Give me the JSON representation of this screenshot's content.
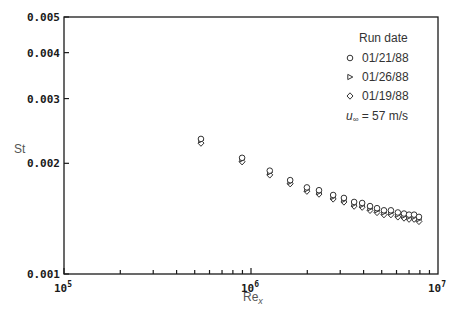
{
  "chart_data": {
    "type": "scatter",
    "title": "",
    "xlabel": "Re",
    "xlabel_sub": "x",
    "ylabel": "St",
    "xscale": "log",
    "yscale": "log",
    "xlim": [
      100000,
      10000000
    ],
    "ylim": [
      0.001,
      0.005
    ],
    "x_ticks": [
      {
        "value": 100000,
        "base": "10",
        "exp": "5"
      },
      {
        "value": 1000000,
        "base": "10",
        "exp": "6"
      },
      {
        "value": 10000000,
        "base": "10",
        "exp": "7"
      }
    ],
    "y_ticks": [
      {
        "value": 0.001,
        "label": "0.001"
      },
      {
        "value": 0.002,
        "label": "0.002"
      },
      {
        "value": 0.003,
        "label": "0.003"
      },
      {
        "value": 0.004,
        "label": "0.004"
      },
      {
        "value": 0.005,
        "label": "0.005"
      }
    ],
    "grid": false,
    "legend_position": "upper right",
    "legend_title": "Run date",
    "annotation": "u∞ = 57 m/s",
    "series": [
      {
        "name": "01/21/88",
        "marker": "circle",
        "x": [
          540000,
          896000,
          1260000,
          1620000,
          1990000,
          2310000,
          2750000,
          3140000,
          3560000,
          3930000,
          4330000,
          4720000,
          5140000,
          5600000,
          6100000,
          6580000,
          7000000,
          7450000,
          7910000
        ],
        "y": [
          0.00233,
          0.00207,
          0.00191,
          0.0018,
          0.00172,
          0.00169,
          0.00164,
          0.00161,
          0.00157,
          0.00156,
          0.00153,
          0.00151,
          0.00149,
          0.00149,
          0.00147,
          0.00146,
          0.00145,
          0.00145,
          0.00143
        ]
      },
      {
        "name": "01/26/88",
        "marker": "triangle-right",
        "x": [
          540000,
          896000,
          1260000,
          1620000,
          1990000,
          2310000,
          2750000,
          3140000,
          3560000,
          3930000,
          4330000,
          4720000,
          5140000,
          5600000,
          6100000,
          6580000,
          7000000,
          7450000,
          7910000
        ],
        "y": [
          0.00231,
          0.00205,
          0.00189,
          0.00178,
          0.0017,
          0.00167,
          0.00162,
          0.00159,
          0.00155,
          0.00154,
          0.00151,
          0.00149,
          0.00147,
          0.00147,
          0.00145,
          0.00144,
          0.00143,
          0.00143,
          0.00141
        ]
      },
      {
        "name": "01/19/88",
        "marker": "diamond",
        "x": [
          540000,
          896000,
          1260000,
          1620000,
          1990000,
          2310000,
          2750000,
          3140000,
          3560000,
          3930000,
          4330000,
          4720000,
          5140000,
          5600000,
          6100000,
          6580000,
          7000000,
          7450000,
          7910000
        ],
        "y": [
          0.00227,
          0.00202,
          0.00186,
          0.00176,
          0.00168,
          0.00165,
          0.0016,
          0.00157,
          0.00153,
          0.00152,
          0.00149,
          0.00147,
          0.00145,
          0.00145,
          0.00143,
          0.00142,
          0.00141,
          0.00141,
          0.00139
        ]
      }
    ]
  },
  "legend": {
    "title": "Run date",
    "items": [
      {
        "label": "01/21/88",
        "marker": "circle"
      },
      {
        "label": "01/26/88",
        "marker": "triangle-right"
      },
      {
        "label": "01/19/88",
        "marker": "diamond"
      }
    ],
    "annotation_symbol": "u",
    "annotation_sub": "∞",
    "annotation_rest": " = 57 m/s"
  },
  "axes": {
    "ylabel": "St",
    "xlabel": "Re",
    "xlabel_sub": "x"
  }
}
